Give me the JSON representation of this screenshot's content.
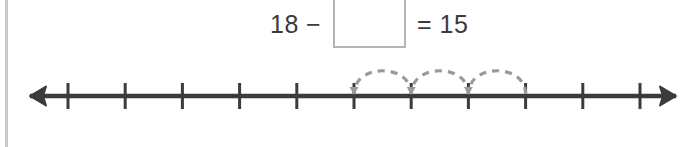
{
  "equation": {
    "left_operand": "18",
    "operator": "−",
    "answer_box_value": "",
    "answer_box_placeholder": "",
    "equals_and_result": "= 15"
  },
  "number_line": {
    "min": 10,
    "max": 20,
    "ticks": [
      {
        "value": 10,
        "label": "10",
        "highlighted": false
      },
      {
        "value": 11,
        "label": "11",
        "highlighted": false
      },
      {
        "value": 12,
        "label": "12",
        "highlighted": false
      },
      {
        "value": 13,
        "label": "13",
        "highlighted": false
      },
      {
        "value": 14,
        "label": "14",
        "highlighted": false
      },
      {
        "value": 15,
        "label": "15",
        "highlighted": true
      },
      {
        "value": 16,
        "label": "16",
        "highlighted": false
      },
      {
        "value": 17,
        "label": "17",
        "highlighted": false
      },
      {
        "value": 18,
        "label": "18",
        "highlighted": false
      },
      {
        "value": 19,
        "label": "19",
        "highlighted": false
      },
      {
        "value": 20,
        "label": "20",
        "highlighted": true
      }
    ],
    "hops": [
      {
        "from": 16,
        "to": 15
      },
      {
        "from": 17,
        "to": 16
      },
      {
        "from": 18,
        "to": 17
      }
    ],
    "left_arrow": true,
    "right_arrow": true
  },
  "colors": {
    "line": "#3b3b3b",
    "text": "#3b3b3b",
    "hop_dash": "#9a9a9a",
    "box_border": "#b4b4b4",
    "highlight_fill": "#e3e3e3",
    "left_rule": "#c9c9c9"
  }
}
